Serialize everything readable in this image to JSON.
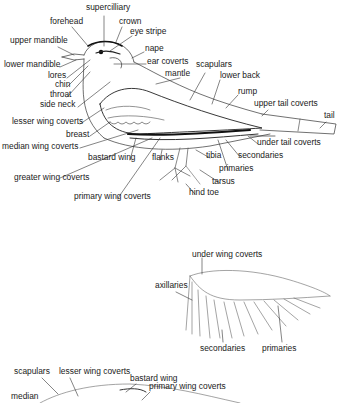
{
  "colors": {
    "ink": "#1a1a1a",
    "line": "#333333",
    "light": "#888888",
    "wing": "#555555",
    "background": "#ffffff"
  },
  "figures": [
    {
      "id": "bird-side-view",
      "labels": [
        {
          "text": "supercilliary",
          "x": 86,
          "y": 7
        },
        {
          "text": "forehead",
          "x": 50,
          "y": 21
        },
        {
          "text": "crown",
          "x": 119,
          "y": 21
        },
        {
          "text": "eye stripe",
          "x": 130,
          "y": 31
        },
        {
          "text": "upper mandible",
          "x": 10,
          "y": 40
        },
        {
          "text": "nape",
          "x": 145,
          "y": 48
        },
        {
          "text": "lower mandible",
          "x": 4,
          "y": 64
        },
        {
          "text": "ear coverts",
          "x": 147,
          "y": 61
        },
        {
          "text": "scapulars",
          "x": 196,
          "y": 64
        },
        {
          "text": "lores",
          "x": 48,
          "y": 75
        },
        {
          "text": "mantle",
          "x": 165,
          "y": 73
        },
        {
          "text": "lower back",
          "x": 220,
          "y": 75
        },
        {
          "text": "chin",
          "x": 55,
          "y": 84
        },
        {
          "text": "throat",
          "x": 50,
          "y": 94
        },
        {
          "text": "rump",
          "x": 238,
          "y": 91
        },
        {
          "text": "side neck",
          "x": 40,
          "y": 104
        },
        {
          "text": "upper tail coverts",
          "x": 254,
          "y": 103
        },
        {
          "text": "lesser wing coverts",
          "x": 12,
          "y": 121
        },
        {
          "text": "tail",
          "x": 324,
          "y": 115
        },
        {
          "text": "breast",
          "x": 66,
          "y": 134
        },
        {
          "text": "under tail coverts",
          "x": 257,
          "y": 142
        },
        {
          "text": "median wing coverts",
          "x": 2,
          "y": 146
        },
        {
          "text": "tibia",
          "x": 206,
          "y": 155
        },
        {
          "text": "secondaries",
          "x": 238,
          "y": 155
        },
        {
          "text": "bastard wing",
          "x": 88,
          "y": 157
        },
        {
          "text": "flanks",
          "x": 152,
          "y": 157
        },
        {
          "text": "primaries",
          "x": 219,
          "y": 168
        },
        {
          "text": "greater wing coverts",
          "x": 14,
          "y": 177
        },
        {
          "text": "tarsus",
          "x": 212,
          "y": 181
        },
        {
          "text": "hind toe",
          "x": 189,
          "y": 192
        },
        {
          "text": "primary wing coverts",
          "x": 74,
          "y": 196
        }
      ]
    },
    {
      "id": "underwing-view",
      "labels": [
        {
          "text": "under wing coverts",
          "x": 192,
          "y": 254
        },
        {
          "text": "axillaries",
          "x": 155,
          "y": 285
        },
        {
          "text": "secondaries",
          "x": 200,
          "y": 348
        },
        {
          "text": "primaries",
          "x": 262,
          "y": 348
        }
      ]
    },
    {
      "id": "upperwing-view",
      "labels": [
        {
          "text": "scapulars",
          "x": 14,
          "y": 371
        },
        {
          "text": "lesser wing coverts",
          "x": 59,
          "y": 371
        },
        {
          "text": "bastard wing",
          "x": 130,
          "y": 378
        },
        {
          "text": "primary wing coverts",
          "x": 149,
          "y": 386
        },
        {
          "text": "median",
          "x": 11,
          "y": 396
        }
      ]
    }
  ]
}
